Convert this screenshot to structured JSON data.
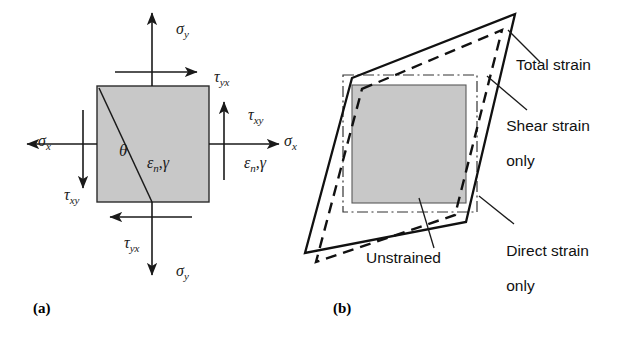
{
  "figure": {
    "colors": {
      "element_fill": "#c8c8c8",
      "element_stroke": "#2b2b2b",
      "line": "#1a1a1a",
      "background": "#ffffff"
    }
  },
  "panel_a": {
    "caption": "(a)",
    "labels": {
      "sigma_y_top": {
        "greek": "σ",
        "sub": "y"
      },
      "sigma_y_bottom": {
        "greek": "σ",
        "sub": "y"
      },
      "sigma_x_left": {
        "greek": "σ",
        "sub": "x"
      },
      "sigma_x_right": {
        "greek": "σ",
        "sub": "x"
      },
      "tau_yx_top": {
        "greek": "τ",
        "sub": "yx"
      },
      "tau_yx_bottom": {
        "greek": "τ",
        "sub": "yx"
      },
      "tau_xy_left": {
        "greek": "τ",
        "sub": "xy"
      },
      "tau_xy_right": {
        "greek": "τ",
        "sub": "xy"
      },
      "theta": {
        "greek": "θ"
      },
      "strain_inside": {
        "greek": "ε",
        "sub": "n",
        "comma": ",",
        "gamma": "γ"
      },
      "strain_right": {
        "greek": "ε",
        "sub": "n",
        "comma": ",",
        "gamma": "γ"
      }
    }
  },
  "panel_b": {
    "caption": "(b)",
    "annotations": [
      {
        "id": "total-strain",
        "text": "Total strain"
      },
      {
        "id": "shear-strain-only",
        "line1": "Shear strain",
        "line2": "only"
      },
      {
        "id": "direct-strain-only",
        "line1": "Direct strain",
        "line2": "only"
      },
      {
        "id": "unstrained",
        "text": "Unstrained"
      }
    ]
  }
}
